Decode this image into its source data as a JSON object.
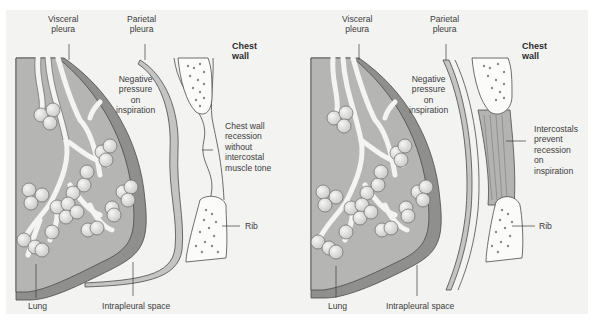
{
  "figure": {
    "colors": {
      "background": "#f3f3f2",
      "lung_fill": "#b9b9b8",
      "pleura_fill": "#9c9c9b",
      "parietal_fill": "#c8c8c7",
      "alveoli_fill": "#e2e2e1",
      "outline": "#4a4a4a"
    },
    "panels": [
      {
        "id": "without-intercostal-tone",
        "labels": {
          "visceral_pleura": [
            "Visceral",
            "pleura"
          ],
          "parietal_pleura": [
            "Parietal",
            "pleura"
          ],
          "chest_wall": [
            "Chest",
            "wall"
          ],
          "negative_pressure": [
            "Negative",
            "pressure",
            "on",
            "inspiration"
          ],
          "annotation": [
            "Chest wall",
            "recession",
            "without",
            "intercostal",
            "muscle tone"
          ],
          "rib": "Rib",
          "lung": "Lung",
          "intrapleural_space": "Intrapleural space"
        }
      },
      {
        "id": "with-intercostal-tone",
        "labels": {
          "visceral_pleura": [
            "Visceral",
            "pleura"
          ],
          "parietal_pleura": [
            "Parietal",
            "pleura"
          ],
          "chest_wall": [
            "Chest",
            "wall"
          ],
          "negative_pressure": [
            "Negative",
            "pressure",
            "on",
            "inspiration"
          ],
          "annotation": [
            "Intercostals",
            "prevent",
            "recession",
            "on",
            "inspiration"
          ],
          "rib": "Rib",
          "lung": "Lung",
          "intrapleural_space": "Intrapleural space"
        }
      }
    ]
  }
}
